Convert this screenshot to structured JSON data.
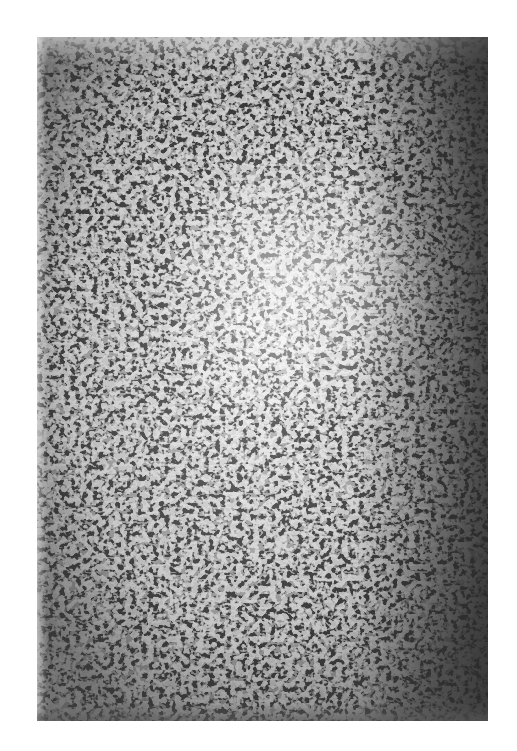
{
  "artwork": {
    "description": "Abstract monochrome painting with dense white calligraphic marks on dark ground",
    "colors": {
      "paper": "#ffffff",
      "ground": "#3a3a3a",
      "marks": "#f2f2f2"
    }
  }
}
